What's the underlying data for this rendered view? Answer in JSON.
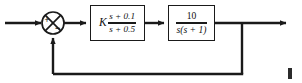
{
  "figure": {
    "type": "control-system-block-diagram",
    "background_color": "#ffffff",
    "line_color": "#1a1a1a"
  },
  "summing_junction": {
    "name": "summing-junction",
    "shape": "circle-with-x",
    "center_x": 53,
    "center_y": 23,
    "radius": 11,
    "inputs": [
      {
        "label": "+",
        "from": "reference-input",
        "direction": "left"
      },
      {
        "label": "−",
        "from": "feedback-path",
        "direction": "bottom"
      }
    ]
  },
  "blocks": [
    {
      "id": "compensator",
      "name": "compensator-block",
      "gain": "K",
      "numerator": "s + 0.1",
      "denominator": "s + 0.5",
      "transfer_function": "K(s + 0.1)/(s + 0.5)"
    },
    {
      "id": "plant",
      "name": "plant-block",
      "gain": "",
      "numerator": "10",
      "denominator": "s(s + 1)",
      "transfer_function": "10/(s(s + 1))"
    }
  ],
  "signals": {
    "input_arrow": "reference input into summing junction",
    "output_arrow": "system output to the right",
    "feedback": "unity feedback from output takeoff back to summing junction negative input"
  }
}
